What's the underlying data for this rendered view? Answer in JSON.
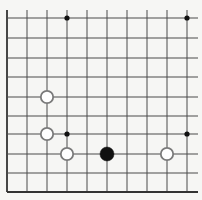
{
  "board": {
    "type": "go-board-fragment",
    "colors": {
      "background": "#f6f6f4",
      "grid_line": "#4a4a4a",
      "edge_line": "#333333",
      "black_stone": "#111111",
      "white_stone_fill": "#ffffff",
      "white_stone_outline": "#7a7a7a",
      "star_point": "#111111"
    },
    "grid": {
      "columns_x": [
        7,
        27,
        47,
        67,
        87,
        107,
        127,
        147,
        167,
        187
      ],
      "rows_y": [
        18,
        38,
        58,
        77,
        97,
        116,
        134,
        154,
        173,
        192
      ],
      "vertical_top": 10,
      "horizontal_right": 198,
      "left_edge": true,
      "bottom_edge": true
    },
    "star_points": [
      {
        "col": 3,
        "row": 0
      },
      {
        "col": 9,
        "row": 0
      },
      {
        "col": 3,
        "row": 6
      },
      {
        "col": 9,
        "row": 6
      }
    ],
    "stones": [
      {
        "color": "white",
        "col": 2,
        "row": 4
      },
      {
        "color": "white",
        "col": 2,
        "row": 6
      },
      {
        "color": "white",
        "col": 3,
        "row": 7
      },
      {
        "color": "black",
        "col": 5,
        "row": 7
      },
      {
        "color": "white",
        "col": 8,
        "row": 7
      }
    ],
    "stone_radius": 7,
    "star_radius": 2.6
  }
}
